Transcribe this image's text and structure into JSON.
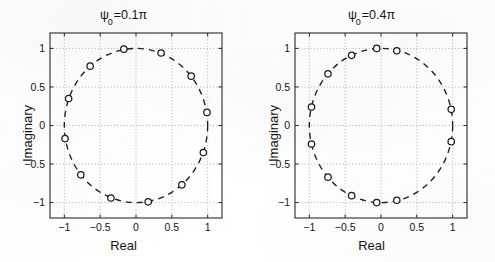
{
  "figure": {
    "background_color": "#ffffff",
    "ink_color": "#1a1a1a",
    "grid_color": "#9a9a9a"
  },
  "panels": [
    {
      "id": "left",
      "title_prefix": "ψ",
      "title_subscript": "0",
      "title_suffix": "=0.1π",
      "title_full": "ψ₀=0.1π",
      "xlabel": "Real",
      "ylabel": "Imaginary",
      "xticklabels": [
        "-1",
        "-0.5",
        "0",
        "0.5",
        "1"
      ],
      "yticklabels": [
        "1",
        "0.5",
        "0",
        "-0.5",
        "-1"
      ]
    },
    {
      "id": "right",
      "title_prefix": "ψ",
      "title_subscript": "0",
      "title_suffix": "=0.4π",
      "title_full": "ψ₀=0.4π",
      "xlabel": "Real",
      "ylabel": "Imaginary",
      "xticklabels": [
        "-1",
        "-0.5",
        "0",
        "0.5",
        "1"
      ],
      "yticklabels": [
        "1",
        "0.5",
        "0",
        "-0.5",
        "-1"
      ]
    }
  ],
  "chart_data": [
    {
      "type": "scatter",
      "title": "ψ₀=0.1π",
      "xlabel": "Real",
      "ylabel": "Imaginary",
      "xlim": [
        -1.2,
        1.2
      ],
      "ylim": [
        -1.2,
        1.2
      ],
      "xticks": [
        -1,
        -0.5,
        0,
        0.5,
        1
      ],
      "yticks": [
        -1,
        -0.5,
        0,
        0.5,
        1
      ],
      "grid": true,
      "legend": "none",
      "series": [
        {
          "name": "unit circle",
          "style": "dashed-line",
          "radius": 1.0,
          "center": [
            0,
            0
          ]
        },
        {
          "name": "roots",
          "style": "open-circle-markers",
          "marker": "o",
          "count": 12,
          "angles_deg": [
            99.7,
            69.7,
            39.7,
            9.7,
            -20.3,
            -50.3,
            -80.3,
            -110.3,
            -140.3,
            -170.3,
            159.7,
            129.7
          ],
          "x": [
            -0.17,
            0.35,
            0.77,
            0.99,
            0.94,
            0.64,
            0.17,
            -0.35,
            -0.77,
            -0.99,
            -0.94,
            -0.64
          ],
          "y": [
            0.99,
            0.94,
            0.64,
            0.17,
            -0.35,
            -0.77,
            -0.99,
            -0.94,
            -0.64,
            -0.17,
            0.35,
            0.77
          ]
        }
      ]
    },
    {
      "type": "scatter",
      "title": "ψ₀=0.4π",
      "xlabel": "Real",
      "ylabel": "Imaginary",
      "xlim": [
        -1.2,
        1.2
      ],
      "ylim": [
        -1.2,
        1.2
      ],
      "xticks": [
        -1,
        -0.5,
        0,
        0.5,
        1
      ],
      "yticks": [
        -1,
        -0.5,
        0,
        0.5,
        1
      ],
      "grid": true,
      "legend": "none",
      "series": [
        {
          "name": "unit circle",
          "style": "dashed-line",
          "radius": 1.0,
          "center": [
            0,
            0
          ]
        },
        {
          "name": "roots",
          "style": "open-circle-markers",
          "marker": "o",
          "count": 12,
          "angles_deg": [
            77.0,
            93.4,
            114.0,
            138.0,
            166.0,
            -166.0,
            -138.0,
            -114.0,
            -93.4,
            -77.0,
            -12.0,
            12.0
          ],
          "x": [
            0.22,
            -0.06,
            -0.41,
            -0.74,
            -0.97,
            -0.97,
            -0.74,
            -0.41,
            -0.06,
            0.22,
            0.98,
            0.98
          ],
          "y": [
            0.97,
            1.0,
            0.91,
            0.67,
            0.24,
            -0.24,
            -0.67,
            -0.91,
            -1.0,
            -0.97,
            -0.21,
            0.21
          ]
        }
      ]
    }
  ]
}
